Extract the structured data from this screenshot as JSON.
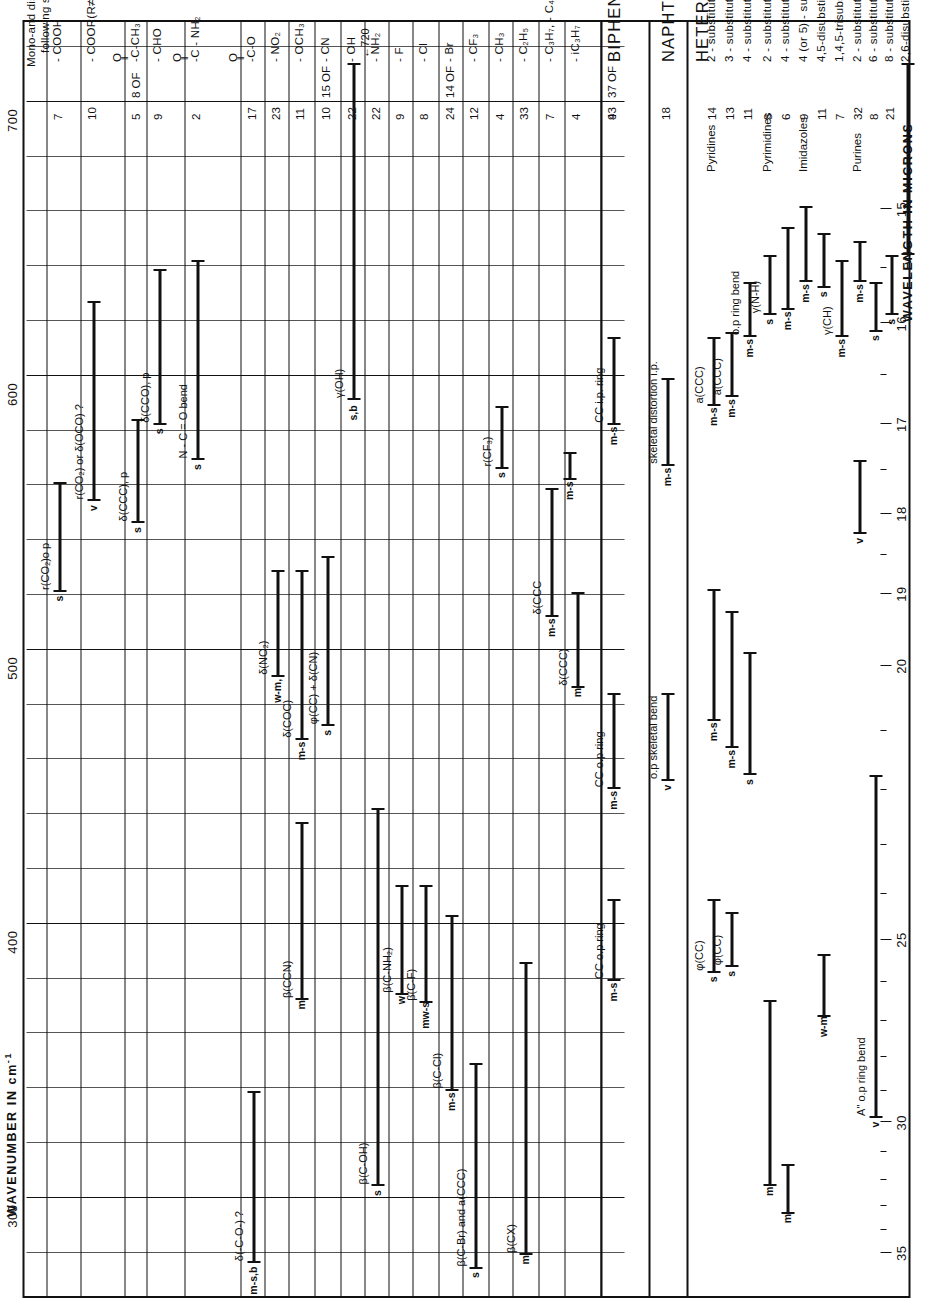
{
  "figure": {
    "top_axis_title": "WAVENUMBER IN cm",
    "top_axis_exponent": "-1",
    "bottom_axis_title": "WAVELENGTH IN MICRONS",
    "intro_line1": "Mono-and disubstituted benzenes with the",
    "intro_line2": "following substituents:"
  },
  "chart_data": {
    "type": "table",
    "xlabel": "WAVENUMBER IN cm-1",
    "xlabel2": "WAVELENGTH IN MICRONS",
    "xlim": [
      730,
      270
    ],
    "grid": true,
    "wavenumber_ticks": [
      300,
      400,
      500,
      600,
      700
    ],
    "wavenumber_minor_ticks": [
      280,
      320,
      340,
      360,
      380,
      420,
      440,
      460,
      480,
      520,
      540,
      560,
      580,
      620,
      640,
      660,
      680,
      720
    ],
    "wavelength_ticks": [
      15,
      16,
      17,
      18,
      19,
      20,
      25,
      30,
      35
    ],
    "groups": [
      {
        "name": "BENZENES",
        "heading": "",
        "rows": [
          {
            "label": "- COOH",
            "count": "7",
            "bands": [
              {
                "from": 567,
                "to": 527,
                "intensity": "s",
                "assign": "r(CO₂)o p"
              }
            ]
          },
          {
            "label": "- COOR(R≠H)",
            "count": "10",
            "bands": [
              {
                "from": 633,
                "to": 560,
                "intensity": "v",
                "assign": "r(CO₂) or δ(OCO) ?"
              }
            ]
          },
          {
            "label": "-C-CH₃",
            "sublabel": "O",
            "count": "5",
            "count_prefix": "8 OF",
            "bands": [
              {
                "from": 590,
                "to": 552,
                "intensity": "s",
                "assign": "δ(CCC), p"
              }
            ]
          },
          {
            "label": "- CHO",
            "count": "9",
            "bands": [
              {
                "from": 645,
                "to": 588,
                "intensity": "s",
                "assign": "δ(CCO), p"
              }
            ]
          },
          {
            "label": "-C - NH₂",
            "sublabel": "O",
            "count": "2",
            "bands": [
              {
                "from": 648,
                "to": 575,
                "intensity": "s",
                "assign": "N - C = O bend"
              }
            ]
          },
          {
            "label": "-C-O",
            "sublabel": "O",
            "count": "17",
            "bands": [
              {
                "from": 345,
                "to": 282,
                "intensity": "m-s,b",
                "assign": "δ(-C-O-) ?"
              }
            ]
          },
          {
            "label": "- NO₂",
            "count": "23",
            "bands": [
              {
                "from": 535,
                "to": 496,
                "intensity": "w-m,",
                "assign": "δ(NO₂)"
              }
            ]
          },
          {
            "label": "- OCH₃",
            "count": "11",
            "bands": [
              {
                "from": 535,
                "to": 473,
                "intensity": "m-s",
                "assign": "δ(COC)"
              }
            ]
          },
          {
            "label": "- CN",
            "count": "10",
            "count_prefix": "15 OF",
            "bands": [
              {
                "from": 540,
                "to": 478,
                "intensity": "s",
                "assign": "φ(CC) + δ(CN)"
              },
              {
                "from": 443,
                "to": 378,
                "intensity": "m",
                "assign": "β(CCN)"
              }
            ]
          },
          {
            "label": "- OH",
            "count": "22",
            "bands": [
              {
                "from": 720,
                "to": 597,
                "intensity": "s,b",
                "assign": "γ(OH)"
              }
            ]
          },
          {
            "label": "- NH₂",
            "count": "22",
            "bands": [
              {
                "from": 448,
                "to": 310,
                "intensity": "s",
                "assign": "β(C-OH)"
              }
            ]
          },
          {
            "label": "- F",
            "count": "9",
            "bands": [
              {
                "from": 420,
                "to": 380,
                "intensity": "w",
                "assign": "β(C-NH₂)"
              }
            ]
          },
          {
            "label": "- Cl",
            "count": "8",
            "bands": [
              {
                "from": 420,
                "to": 377,
                "intensity": "mw-s",
                "assign": "β(C-F)"
              }
            ]
          },
          {
            "label": "- Br",
            "count": "24",
            "count_prefix": "14 OF",
            "bands": [
              {
                "from": 409,
                "to": 345,
                "intensity": "m-s",
                "assign": "β(C-Cl)"
              }
            ]
          },
          {
            "label": "- CF₃",
            "count": "12",
            "bands": [
              {
                "from": 355,
                "to": 280,
                "intensity": "s",
                "assign": "β(C-Br) and a(CCC)"
              }
            ]
          },
          {
            "label": "- CH₃",
            "count": "4",
            "bands": [
              {
                "from": 595,
                "to": 572,
                "intensity": "s",
                "assign": "r(CF₃)"
              }
            ]
          },
          {
            "label": "- C₂H₅",
            "count": "33",
            "bands": [
              {
                "from": 392,
                "to": 285,
                "intensity": "m",
                "assign": "β(CX)"
              }
            ]
          },
          {
            "label": "- C₃H₇, - C₄H₉, - C₁₀H₂₁",
            "count": "7",
            "bands": [
              {
                "from": 565,
                "to": 518,
                "intensity": "m-s",
                "assign": "δ(CCC"
              },
              {
                "from": 578,
                "to": 568,
                "intensity": "m-s m-s",
                "assign": ""
              }
            ]
          },
          {
            "label": "- iC₃H₇",
            "count": "4",
            "bands": [
              {
                "from": 527,
                "to": 492,
                "intensity": "m",
                "assign": "δ(CCC)"
              }
            ]
          }
        ]
      },
      {
        "name": "BIPHENYLS",
        "heading": "BIPHENYLS",
        "rows": [
          {
            "label": "",
            "count": "43",
            "count_prefix": "37 OF",
            "bands": [
              {
                "from": 620,
                "to": 588,
                "intensity": "m-s",
                "assign": "CC i.p. ring"
              },
              {
                "from": 490,
                "to": 455,
                "intensity": "m-s",
                "assign": "CC o.p ring"
              },
              {
                "from": 415,
                "to": 385,
                "intensity": "m-s",
                "assign": "CC o.p ring"
              }
            ]
          },
          {
            "label": "",
            "count": "9",
            "bands": []
          }
        ]
      },
      {
        "name": "NAPHTHALENES",
        "heading": "NAPHTHALENES",
        "rows": [
          {
            "label": "",
            "count": "18",
            "bands": [
              {
                "from": 605,
                "to": 573,
                "intensity": "m-s",
                "assign": "skeletal distortion i.p."
              },
              {
                "from": 490,
                "to": 458,
                "intensity": "v",
                "assign": "o.p skeletal bend"
              }
            ]
          }
        ]
      },
      {
        "name": "HETEROCYCLICS",
        "heading": "HETEROCYCLICS",
        "rows": [
          {
            "group": "Pyridines",
            "label": "2 - substituted",
            "count": "14",
            "bands": [
              {
                "from": 620,
                "to": 595,
                "intensity": "m-s",
                "assign": "a(CCC)"
              },
              {
                "from": 528,
                "to": 480,
                "intensity": "m-s",
                "assign": ""
              },
              {
                "from": 415,
                "to": 388,
                "intensity": "s",
                "assign": "φ(CC)"
              }
            ]
          },
          {
            "group": "",
            "label": "3 - substituted",
            "count": "13",
            "bands": [
              {
                "from": 622,
                "to": 598,
                "intensity": "m-s",
                "assign": "a(CCC)"
              },
              {
                "from": 520,
                "to": 470,
                "intensity": "m-s",
                "assign": ""
              },
              {
                "from": 410,
                "to": 390,
                "intensity": "s",
                "assign": "φ(CC)"
              }
            ]
          },
          {
            "group": "",
            "label": "4 - substituted",
            "count": "11",
            "bands": [
              {
                "from": 640,
                "to": 620,
                "intensity": "m-s",
                "assign": "o.p ring bend"
              },
              {
                "from": 505,
                "to": 460,
                "intensity": "s",
                "assign": ""
              }
            ]
          },
          {
            "group": "Pyrimidines",
            "label": "2 - substituted",
            "count": "8",
            "bands": [
              {
                "from": 650,
                "to": 628,
                "intensity": "s",
                "assign": "γ(N-H)"
              },
              {
                "from": 378,
                "to": 310,
                "intensity": "m",
                "assign": ""
              }
            ]
          },
          {
            "group": "",
            "label": "4 - substituted",
            "count": "6",
            "bands": [
              {
                "from": 660,
                "to": 630,
                "intensity": "m-s",
                "assign": ""
              },
              {
                "from": 318,
                "to": 300,
                "intensity": "m",
                "assign": ""
              }
            ]
          },
          {
            "group": "Imidazoles",
            "label": "4 (or 5) - substituted",
            "count": "9",
            "bands": [
              {
                "from": 668,
                "to": 640,
                "intensity": "m-s",
                "assign": ""
              }
            ]
          },
          {
            "group": "",
            "label": "4,5-disubstituted",
            "count": "11",
            "bands": [
              {
                "from": 658,
                "to": 638,
                "intensity": "s",
                "assign": ""
              },
              {
                "from": 395,
                "to": 372,
                "intensity": "w-m",
                "assign": ""
              }
            ]
          },
          {
            "group": "",
            "label": "1,4,5-trisubstituted",
            "count": "7",
            "bands": [
              {
                "from": 648,
                "to": 620,
                "intensity": "m-s",
                "assign": "γ(CH)"
              }
            ]
          },
          {
            "group": "Purines",
            "label": "2 - substituted",
            "count": "32",
            "bands": [
              {
                "from": 655,
                "to": 640,
                "intensity": "m-s",
                "assign": ""
              },
              {
                "from": 575,
                "to": 548,
                "intensity": "v",
                "assign": ""
              }
            ]
          },
          {
            "group": "",
            "label": "6 - substituted",
            "count": "8",
            "bands": [
              {
                "from": 640,
                "to": 622,
                "intensity": "s",
                "assign": ""
              },
              {
                "from": 460,
                "to": 335,
                "intensity": "v",
                "assign": "A\" o.p ring bend"
              }
            ]
          },
          {
            "group": "",
            "label": "8 - substituted",
            "count": "21",
            "bands": [
              {
                "from": 650,
                "to": 628,
                "intensity": "s",
                "assign": ""
              }
            ]
          },
          {
            "group": "",
            "label": "2,6-disubstituted",
            "count": "",
            "bands": [
              {
                "from": 720,
                "to": 650,
                "intensity": "v",
                "assign": ""
              }
            ]
          }
        ]
      }
    ],
    "annotations": [
      {
        "text": "←720",
        "near": "- OH"
      },
      {
        "text": "8 OF",
        "near": "-C-CH3"
      },
      {
        "text": "15 OF",
        "near": "- CN"
      },
      {
        "text": "14 OF",
        "near": "- Br"
      },
      {
        "text": "37 OF",
        "near": "- iC3H7"
      }
    ]
  },
  "rows": [
    {
      "id": "cooh",
      "label": "- COOH",
      "count": "7",
      "prefix": ""
    },
    {
      "id": "coor",
      "label": "- COOR(R≠H)",
      "count": "10",
      "prefix": ""
    },
    {
      "id": "cch3",
      "label": "-C-CH₃",
      "count": "5",
      "prefix": "8 OF",
      "upper": "O",
      "dbl": "‖"
    },
    {
      "id": "cho",
      "label": "- CHO",
      "count": "9",
      "prefix": ""
    },
    {
      "id": "cnh2",
      "label": "-C - NH₂",
      "count": "2",
      "prefix": "",
      "upper": "O"
    },
    {
      "id": "cminuso",
      "label": "-C-O",
      "count": "17",
      "prefix": "",
      "upper": "O"
    },
    {
      "id": "no2",
      "label": "- NO₂",
      "count": "23",
      "prefix": ""
    },
    {
      "id": "och3",
      "label": "- OCH₃",
      "count": "11",
      "prefix": ""
    },
    {
      "id": "cn",
      "label": "- CN",
      "count": "10",
      "prefix": "15 OF"
    },
    {
      "id": "oh",
      "label": "- OH",
      "count": "22",
      "prefix": ""
    },
    {
      "id": "nh2",
      "label": "- NH₂",
      "count": "22",
      "prefix": ""
    },
    {
      "id": "f",
      "label": "- F",
      "count": "9",
      "prefix": ""
    },
    {
      "id": "cl",
      "label": "- Cl",
      "count": "8",
      "prefix": ""
    },
    {
      "id": "br",
      "label": "- Br",
      "count": "24",
      "prefix": "14 OF"
    },
    {
      "id": "cf3",
      "label": "- CF₃",
      "count": "12",
      "prefix": ""
    },
    {
      "id": "ch3",
      "label": "- CH₃",
      "count": "4",
      "prefix": ""
    },
    {
      "id": "c2h5",
      "label": "- C₂H₅",
      "count": "33",
      "prefix": ""
    },
    {
      "id": "c3h7",
      "label": "- C₃H₇, - C₄H₉, - C₁₀H₂₁",
      "count": "7",
      "prefix": ""
    },
    {
      "id": "ic3h7",
      "label": "- iC₃H₇",
      "count": "4",
      "prefix": ""
    },
    {
      "id": "biphenyls",
      "label": "BIPHENYLS",
      "count": "43",
      "prefix": "37 OF",
      "kind": "head"
    },
    {
      "id": "biph2",
      "label": "",
      "count": "9",
      "prefix": ""
    },
    {
      "id": "naph",
      "label": "NAPHTHALENES",
      "count": "18",
      "prefix": "",
      "kind": "head"
    },
    {
      "id": "hetero",
      "label": "HETEROCYCLICS",
      "count": "",
      "prefix": "",
      "kind": "head"
    },
    {
      "id": "py2",
      "label": "2 - substituted",
      "group": "Pyridines",
      "count": "14",
      "prefix": ""
    },
    {
      "id": "py3",
      "label": "3 - substituted",
      "group": "",
      "count": "13",
      "prefix": ""
    },
    {
      "id": "py4",
      "label": "4 - substituted",
      "group": "",
      "count": "11",
      "prefix": ""
    },
    {
      "id": "pm2",
      "label": "2 - substituted",
      "group": "Pyrimidines",
      "count": "8",
      "prefix": ""
    },
    {
      "id": "pm4",
      "label": "4 - substituted",
      "group": "",
      "count": "6",
      "prefix": ""
    },
    {
      "id": "im45",
      "label": "4 (or 5) - substituted",
      "group": "Imidazoles",
      "count": "9",
      "prefix": ""
    },
    {
      "id": "im45d",
      "label": "4,5-disubstituted",
      "group": "",
      "count": "11",
      "prefix": ""
    },
    {
      "id": "im145",
      "label": "1,4,5-trisubstituted",
      "group": "",
      "count": "7",
      "prefix": ""
    },
    {
      "id": "pu2",
      "label": "2 - substituted",
      "group": "Purines",
      "count": "32",
      "prefix": ""
    },
    {
      "id": "pu6",
      "label": "6 - substituted",
      "group": "",
      "count": "8",
      "prefix": ""
    },
    {
      "id": "pu8",
      "label": "8 - substituted",
      "group": "",
      "count": "21",
      "prefix": ""
    },
    {
      "id": "pu26",
      "label": "2,6-disubstituted",
      "group": "",
      "count": "",
      "prefix": ""
    }
  ],
  "band_labels": {
    "b1": "r(CO₂)o p",
    "b2": "r(CO₂) or δ(OCO) ?",
    "b3": "δ(CCC), p",
    "b4": "δ(CCO), p",
    "b5": "N - C = O bend",
    "b6": "δ(-C-O-) ?",
    "b7": "δ(NO₂)",
    "b8": "δ(COC)",
    "b9": "φ(CC) + δ(CN)",
    "b10": "β(CCN)",
    "b11": "γ(OH)",
    "b12": "β(C-OH)",
    "b13": "β(C-NH₂)",
    "b14": "β(C-F)",
    "b15": "β(C-Cl)",
    "b16": "β(C-Br) and a(CCC)",
    "b17": "r(CF₃)",
    "b18": "β(CX)",
    "b19": "δ(CCC",
    "b20": "δ(CCC)",
    "b21": "CC i.p. ring",
    "b22": "CC o.p ring",
    "b23": "CC o.p. ring",
    "b24": "skeletal distortion i.p.",
    "b25": "o.p skeletal bend",
    "b26": "a(CCC)",
    "b27": "a(CCC)",
    "b28": "o.p ring bend",
    "b29": "γ(N-H)",
    "b30": "φ(CC)",
    "b31": "γ(CH)",
    "b32": "A\" o.p ring bend",
    "arrow720": "←720"
  },
  "intensities": {
    "s": "s",
    "m": "m",
    "v": "v",
    "w": "w",
    "ms": "m-s",
    "msb": "m-s,b",
    "sb": "s,b",
    "wm": "w-m,",
    "mws": "mw-s",
    "wm2": "w-m"
  }
}
